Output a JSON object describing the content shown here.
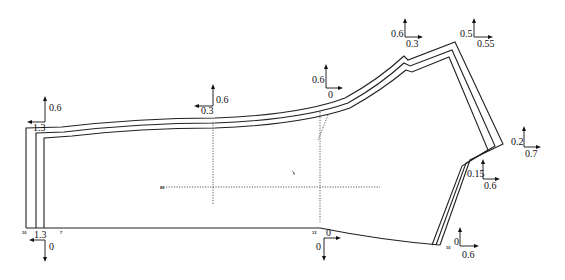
{
  "diagram": {
    "type": "garment-pattern-grading",
    "stroke_color": "#222222",
    "background": "#ffffff",
    "grade_points": [
      {
        "id": "p1",
        "name": "top-left-corner",
        "x_value": "1.3",
        "y_value": "0.6",
        "x_dir": "left",
        "y_dir": "up"
      },
      {
        "id": "p2",
        "name": "bottom-left-corner",
        "x_value": "1.3",
        "y_value": "0",
        "x_dir": "left",
        "y_dir": "down"
      },
      {
        "id": "p3",
        "name": "top-mid-left",
        "x_value": "0.3",
        "y_value": "0.6",
        "x_dir": "left",
        "y_dir": "up"
      },
      {
        "id": "p4",
        "name": "top-mid-right",
        "x_value": "0",
        "y_value": "0.6",
        "x_dir": "right",
        "y_dir": "up"
      },
      {
        "id": "p5",
        "name": "notch-point",
        "x_value": "0.3",
        "y_value": "0.6",
        "x_dir": "right",
        "y_dir": "up"
      },
      {
        "id": "p6",
        "name": "top-right-corner",
        "x_value": "0.55",
        "y_value": "0.5",
        "x_dir": "right",
        "y_dir": "up"
      },
      {
        "id": "p7",
        "name": "right-tip",
        "x_value": "0.7",
        "y_value": "0.2",
        "x_dir": "right",
        "y_dir": "up"
      },
      {
        "id": "p8",
        "name": "right-inner-corner",
        "x_value": "0.6",
        "y_value": "0.15",
        "x_dir": "right",
        "y_dir": "up"
      },
      {
        "id": "p9",
        "name": "bottom-right-corner",
        "x_value": "0.6",
        "y_value": "0",
        "x_dir": "right",
        "y_dir": "up"
      },
      {
        "id": "p10",
        "name": "bottom-mid",
        "x_value": "0",
        "y_value": "0",
        "x_dir": "right",
        "y_dir": "down"
      }
    ],
    "small_marks": {
      "bottom_left_a": "10",
      "bottom_left_b": "7",
      "bottom_mid": "12",
      "bottom_right": "10",
      "center_line": "88"
    }
  }
}
